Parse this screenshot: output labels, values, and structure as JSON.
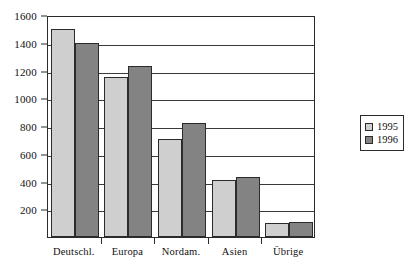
{
  "chart_data": {
    "type": "bar",
    "title": "",
    "subtitle": "",
    "xlabel": "",
    "ylabel": "",
    "categories": [
      "Deutschl.",
      "Europa",
      "Nordam.",
      "Asien",
      "Übrige"
    ],
    "series": [
      {
        "name": "1995",
        "color": "#cfcfcf",
        "values": [
          1500,
          1150,
          710,
          410,
          100
        ]
      },
      {
        "name": "1996",
        "color": "#838383",
        "values": [
          1400,
          1230,
          820,
          430,
          110
        ]
      }
    ],
    "ylim": [
      0,
      1600
    ],
    "ytick_labels": [
      "1600",
      "1400",
      "1200",
      "1000",
      "800",
      "600",
      "400",
      "200"
    ],
    "ytick_values": [
      1600,
      1400,
      1200,
      1000,
      800,
      600,
      400,
      200
    ],
    "grid": true,
    "legend_position": "right",
    "legend_entries": [
      "1995",
      "1996"
    ]
  }
}
